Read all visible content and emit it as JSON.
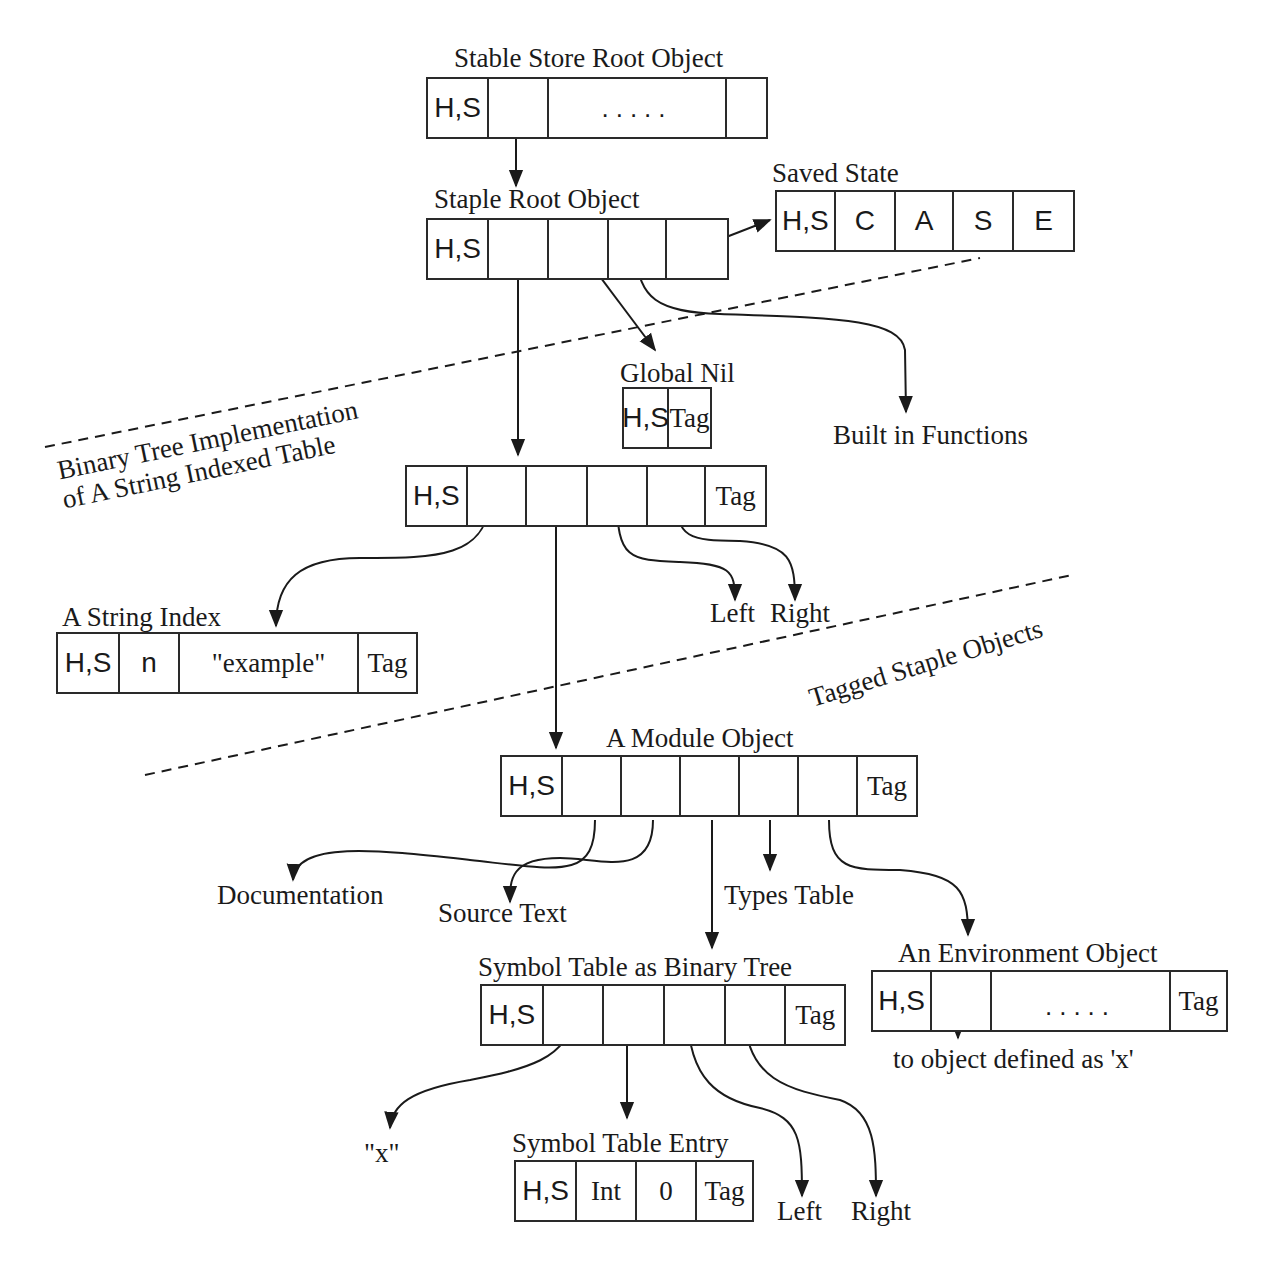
{
  "diagram": {
    "objects": {
      "stable_store_root": {
        "title": "Stable Store Root Object",
        "cells": [
          "H,S",
          "",
          ".....",
          ""
        ]
      },
      "staple_root": {
        "title": "Staple Root Object",
        "cells": [
          "H,S",
          "",
          "",
          "",
          ""
        ]
      },
      "saved_state": {
        "title": "Saved State",
        "cells": [
          "H,S",
          "C",
          "A",
          "S",
          "E"
        ]
      },
      "global_nil": {
        "title": "Global Nil",
        "cells": [
          "H,S",
          "Tag"
        ]
      },
      "binary_tree_node": {
        "title": "",
        "cells": [
          "H,S",
          "",
          "",
          "",
          "",
          "Tag"
        ]
      },
      "string_index": {
        "title": "A String Index",
        "cells": [
          "H,S",
          "n",
          "\"example\"",
          "Tag"
        ]
      },
      "module_object": {
        "title": "A Module Object",
        "cells": [
          "H,S",
          "",
          "",
          "",
          "",
          "",
          "Tag"
        ]
      },
      "symbol_table_tree": {
        "title": "Symbol Table as Binary Tree",
        "cells": [
          "H,S",
          "",
          "",
          "",
          "",
          "Tag"
        ]
      },
      "environment_object": {
        "title": "An Environment Object",
        "cells": [
          "H,S",
          "",
          ".....",
          "Tag"
        ]
      },
      "symbol_table_entry": {
        "title": "Symbol Table Entry",
        "cells": [
          "H,S",
          "Int",
          "0",
          "Tag"
        ]
      }
    },
    "targets": {
      "built_in_functions": "Built in Functions",
      "left_1": "Left",
      "right_1": "Right",
      "documentation": "Documentation",
      "source_text": "Source Text",
      "types_table": "Types Table",
      "x_string": "\"x\"",
      "left_2": "Left",
      "right_2": "Right",
      "object_defined_x": "to object defined as 'x'"
    },
    "regions": {
      "binary_tree_line1": "Binary Tree Implementation",
      "binary_tree_line2": "of A String Indexed Table",
      "tagged_staple": "Tagged Staple Objects"
    },
    "colors": {
      "ink": "#1a1a1a",
      "background": "#ffffff"
    }
  }
}
